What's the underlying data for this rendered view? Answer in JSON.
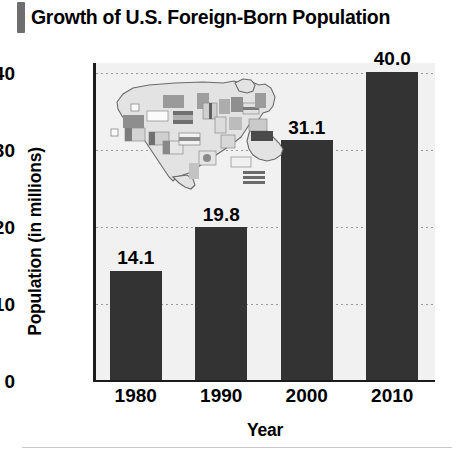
{
  "title": "Growth of U.S. Foreign-Born Population",
  "footer_rule": "",
  "axes": {
    "x_title": "Year",
    "y_title": "Population (in millions)"
  },
  "chart_data": {
    "type": "bar",
    "title": "Growth of U.S. Foreign-Born Population",
    "xlabel": "Year",
    "ylabel": "Population (in millions)",
    "categories": [
      "1980",
      "1990",
      "2000",
      "2010"
    ],
    "values": [
      14.1,
      19.8,
      31.1,
      40.0
    ],
    "value_labels": [
      "14.1",
      "19.8",
      "31.1",
      "40.0"
    ],
    "ylim": [
      0,
      40
    ],
    "yticks": [
      0,
      10,
      20,
      30,
      40
    ],
    "ytick_labels": [
      "0",
      "10",
      "20",
      "30",
      "40"
    ],
    "grid": true,
    "grid_style": "dotted-horizontal",
    "legend": "none",
    "bar_color": "#333333",
    "plot_background": "#f1f1f1",
    "annotations": [
      "United States map inset filled with national flags"
    ]
  },
  "inset": {
    "name": "us-map-with-flags",
    "description": "Outline map of the contiguous United States filled with small national flag rectangles"
  }
}
